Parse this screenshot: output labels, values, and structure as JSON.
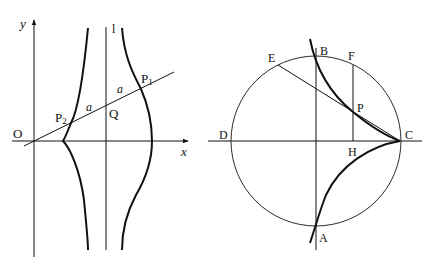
{
  "left_figure": {
    "axis_x_label": "x",
    "axis_y_label": "y",
    "origin_label": "O",
    "line_label": "l",
    "point_q": "Q",
    "point_p1": "P",
    "point_p1_sub": "1",
    "point_p2": "P",
    "point_p2_sub": "2",
    "segment_label_1": "a",
    "segment_label_2": "a"
  },
  "right_figure": {
    "labels": {
      "A": "A",
      "B": "B",
      "C": "C",
      "D": "D",
      "E": "E",
      "F": "F",
      "H": "H",
      "P": "P"
    }
  }
}
